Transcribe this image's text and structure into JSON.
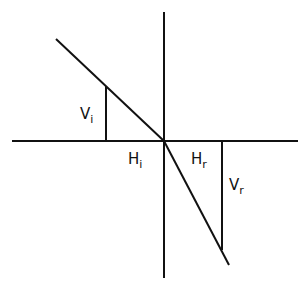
{
  "diagram": {
    "type": "refraction-slope-diagram",
    "labels": {
      "vi_main": "V",
      "vi_sub": "i",
      "hi_main": "H",
      "hi_sub": "i",
      "hr_main": "H",
      "hr_sub": "r",
      "vr_main": "V",
      "vr_sub": "r"
    },
    "stroke_color": "#111111",
    "background": "#ffffff"
  }
}
